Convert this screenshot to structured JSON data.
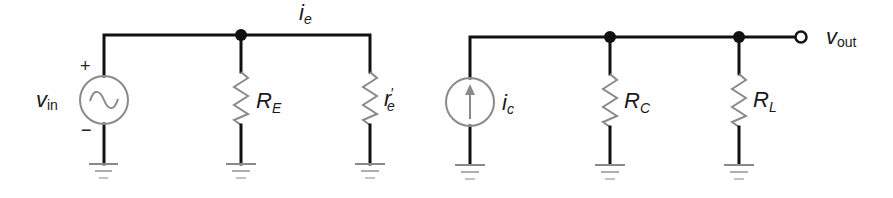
{
  "diagram": {
    "type": "circuit-schematic",
    "colors": {
      "wire": "#111111",
      "component": "#8a8a8a",
      "background": "#ffffff"
    },
    "input_section": {
      "source": {
        "symbol": "ac-voltage-source",
        "label_main": "v",
        "label_sub": "in",
        "plus": "+",
        "minus": "−"
      },
      "current": {
        "label_main": "i",
        "label_sub": "e"
      },
      "resistor_1": {
        "label_main": "R",
        "label_sub": "E"
      },
      "resistor_2": {
        "label_main": "r",
        "label_prime": "′",
        "label_sub": "e"
      }
    },
    "output_section": {
      "source": {
        "symbol": "dc-current-source-up-arrow",
        "label_main": "i",
        "label_sub": "c"
      },
      "resistor_1": {
        "label_main": "R",
        "label_sub": "C"
      },
      "resistor_2": {
        "label_main": "R",
        "label_sub": "L"
      },
      "output": {
        "label_main": "v",
        "label_sub": "out"
      }
    }
  }
}
